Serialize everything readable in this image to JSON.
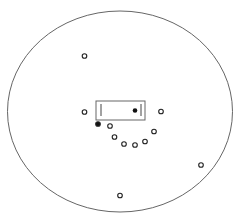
{
  "diagram": {
    "background": "#ffffff",
    "stroke_color": "#555555",
    "boundary": {
      "shape": "ellipse",
      "cx": 120,
      "cy": 111.5,
      "rx": 112.5,
      "ry": 100.5
    },
    "box": {
      "x": 96,
      "y": 101,
      "width": 49,
      "height": 19,
      "left_bar": {
        "x": 101,
        "y1": 104,
        "y2": 116
      },
      "right_bar": {
        "x": 141,
        "y1": 104,
        "y2": 116
      },
      "inner_dot": {
        "cx": 135,
        "cy": 110.5,
        "filled": true
      }
    },
    "points": [
      {
        "cx": 84.5,
        "cy": 56,
        "filled": false
      },
      {
        "cx": 84.5,
        "cy": 112,
        "filled": false
      },
      {
        "cx": 161,
        "cy": 111.5,
        "filled": false
      },
      {
        "cx": 98,
        "cy": 124,
        "filled": true
      },
      {
        "cx": 110,
        "cy": 126,
        "filled": false
      },
      {
        "cx": 154,
        "cy": 131.5,
        "filled": false
      },
      {
        "cx": 114.5,
        "cy": 137,
        "filled": false
      },
      {
        "cx": 124,
        "cy": 144,
        "filled": false
      },
      {
        "cx": 135,
        "cy": 145,
        "filled": false
      },
      {
        "cx": 145,
        "cy": 141.5,
        "filled": false
      },
      {
        "cx": 201,
        "cy": 165,
        "filled": false
      },
      {
        "cx": 120,
        "cy": 195.5,
        "filled": false
      }
    ],
    "point_radius": 2.3
  }
}
